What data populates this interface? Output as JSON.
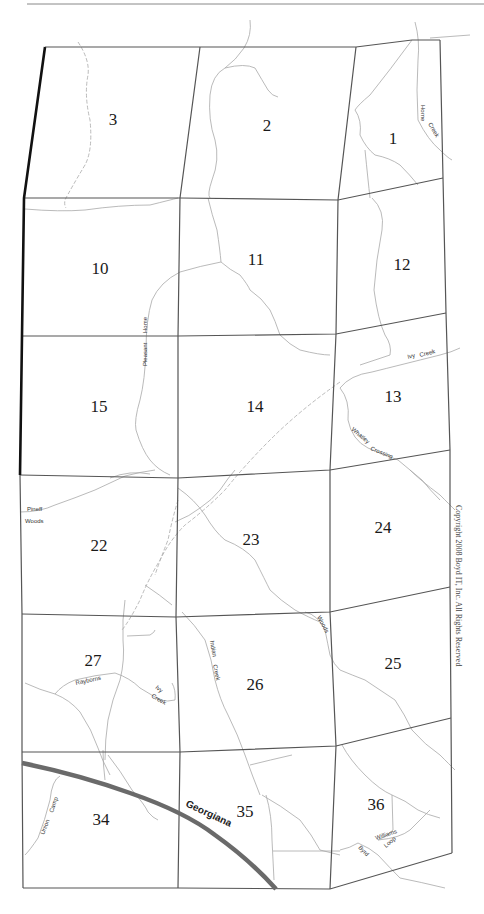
{
  "map": {
    "sections": [
      {
        "id": "1",
        "label": "1",
        "x": 393,
        "y": 140
      },
      {
        "id": "2",
        "label": "2",
        "x": 267,
        "y": 131
      },
      {
        "id": "3",
        "label": "3",
        "x": 113,
        "y": 125
      },
      {
        "id": "10",
        "label": "10",
        "x": 100,
        "y": 274
      },
      {
        "id": "11",
        "label": "11",
        "x": 256,
        "y": 265
      },
      {
        "id": "12",
        "label": "12",
        "x": 402,
        "y": 270
      },
      {
        "id": "13",
        "label": "13",
        "x": 393,
        "y": 402
      },
      {
        "id": "14",
        "label": "14",
        "x": 255,
        "y": 412
      },
      {
        "id": "15",
        "label": "15",
        "x": 99,
        "y": 412
      },
      {
        "id": "22",
        "label": "22",
        "x": 99,
        "y": 551
      },
      {
        "id": "23",
        "label": "23",
        "x": 251,
        "y": 545
      },
      {
        "id": "24",
        "label": "24",
        "x": 383,
        "y": 533
      },
      {
        "id": "25",
        "label": "25",
        "x": 393,
        "y": 669
      },
      {
        "id": "26",
        "label": "26",
        "x": 255,
        "y": 690
      },
      {
        "id": "27",
        "label": "27",
        "x": 93,
        "y": 666
      },
      {
        "id": "34",
        "label": "34",
        "x": 101,
        "y": 825
      },
      {
        "id": "35",
        "label": "35",
        "x": 245,
        "y": 817
      },
      {
        "id": "36",
        "label": "36",
        "x": 376,
        "y": 810
      }
    ],
    "road_labels": {
      "horne_creek_1": "Horne",
      "horne_creek_2": "Creek",
      "pleasant_home_1": "Pleasant",
      "pleasant_home_2": "Home",
      "ivy_creek_13_1": "Ivy",
      "ivy_creek_13_2": "Creek",
      "whatley_crossing_1": "Whatley",
      "whatley_crossing_2": "Crossing",
      "pineff_woods_1": "Pineff",
      "pineff_woods_2": "Woods",
      "woods": "Woods",
      "indian_creek_1": "Indian",
      "indian_creek_2": "Creek",
      "rayborns": "Rayborns",
      "ivy_creek_27_1": "Ivy",
      "ivy_creek_27_2": "Creek",
      "union_camp_1": "Union",
      "union_camp_2": "Camp",
      "williams_loop_1": "Williams",
      "williams_loop_2": "Loop",
      "byrd": "Byrd"
    },
    "highway_label": "Georgiana",
    "copyright": "Copyright 2008 Boyd IT, Inc. All Rights Reserved",
    "colors": {
      "grid": "#555555",
      "boundary": "#111111",
      "road": "#a8a8a8",
      "highway": "#6a6a6a"
    }
  }
}
